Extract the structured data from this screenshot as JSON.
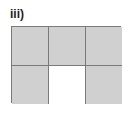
{
  "label": "iii)",
  "grid": {
    "rows": 2,
    "cols": 3,
    "cells": [
      {
        "row": 0,
        "col": 0,
        "shaded": true
      },
      {
        "row": 0,
        "col": 1,
        "shaded": true
      },
      {
        "row": 0,
        "col": 2,
        "shaded": true
      },
      {
        "row": 1,
        "col": 0,
        "shaded": true
      },
      {
        "row": 1,
        "col": 1,
        "shaded": false
      },
      {
        "row": 1,
        "col": 2,
        "shaded": true
      }
    ],
    "shaded_count": 5,
    "total_count": 6,
    "colors": {
      "shaded": "#d0d0d0",
      "unshaded": "#ffffff",
      "border": "#7a7a7a"
    }
  }
}
